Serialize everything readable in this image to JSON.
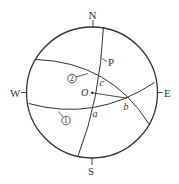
{
  "diagram": {
    "type": "celestial-sphere",
    "directions": {
      "north": "N",
      "south": "S",
      "east": "E",
      "west": "W"
    },
    "center_label": "O",
    "points": {
      "a": "a",
      "b": "b",
      "c": "c",
      "p": "P"
    },
    "curves": {
      "curve1": "1",
      "curve2": "2"
    },
    "colors": {
      "stroke": "#333333",
      "background": "#ffffff"
    }
  }
}
